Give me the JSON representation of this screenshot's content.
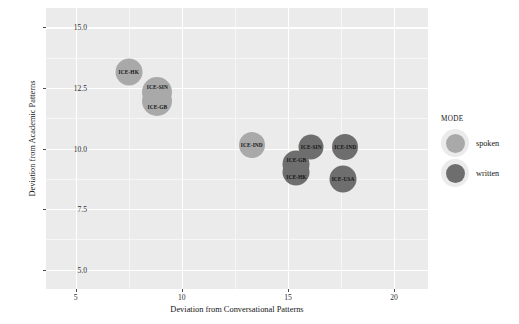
{
  "chart_data": {
    "type": "scatter",
    "title": "",
    "xlabel": "Deviation from Conversational Patterns",
    "ylabel": "Deviation from Academic Patterns",
    "xlim": [
      3.6,
      21.6
    ],
    "ylim": [
      4.2,
      15.8
    ],
    "xticks": [
      "5",
      "10",
      "15",
      "20"
    ],
    "xtick_values": [
      5,
      10,
      15,
      20
    ],
    "yticks": [
      "15.0",
      "12.5",
      "10.0",
      "7.5",
      "5.0"
    ],
    "ytick_values": [
      15.0,
      12.5,
      10.0,
      7.5,
      5.0
    ],
    "grid": true,
    "legend": {
      "title": "MODE",
      "position": "right",
      "entries": [
        {
          "label": "spoken",
          "color": "#a9a9a9"
        },
        {
          "label": "written",
          "color": "#6e6e6e"
        }
      ]
    },
    "points": [
      {
        "label": "ICE-HK",
        "x": 7.5,
        "y": 13.15,
        "mode": "spoken",
        "r": 13.5,
        "label_dx": 0,
        "label_dy": 0
      },
      {
        "label": "ICE-SIN",
        "x": 8.85,
        "y": 12.35,
        "mode": "spoken",
        "r": 15.0,
        "label_dx": 0,
        "label_dy": -5
      },
      {
        "label": "ICE-GB",
        "x": 8.85,
        "y": 11.95,
        "mode": "spoken",
        "r": 15.0,
        "label_dx": 0,
        "label_dy": 6
      },
      {
        "label": "ICE-IND",
        "x": 13.3,
        "y": 10.15,
        "mode": "spoken",
        "r": 13.0,
        "label_dx": 0,
        "label_dy": 0
      },
      {
        "label": "ICE-SIN",
        "x": 16.1,
        "y": 10.05,
        "mode": "written",
        "r": 12.5,
        "label_dx": 0,
        "label_dy": 0
      },
      {
        "label": "ICE-IND",
        "x": 17.7,
        "y": 10.05,
        "mode": "written",
        "r": 13.0,
        "label_dx": 0,
        "label_dy": 0
      },
      {
        "label": "ICE-GB",
        "x": 15.4,
        "y": 9.35,
        "mode": "written",
        "r": 13.5,
        "label_dx": 0,
        "label_dy": -4
      },
      {
        "label": "ICE-HK",
        "x": 15.4,
        "y": 9.05,
        "mode": "written",
        "r": 13.5,
        "label_dx": 0,
        "label_dy": 5
      },
      {
        "label": "ICE-USA",
        "x": 17.6,
        "y": 8.75,
        "mode": "written",
        "r": 13.5,
        "label_dx": 0,
        "label_dy": 0
      }
    ],
    "minor_x": [
      7.5,
      12.5,
      17.5
    ],
    "minor_y": [
      13.75,
      11.25,
      8.75,
      6.25
    ]
  }
}
